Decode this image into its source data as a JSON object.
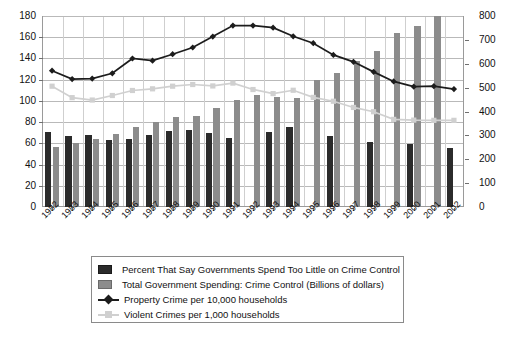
{
  "chart_data": {
    "type": "bar",
    "title": "",
    "subtitle": "",
    "xlabel": "",
    "ylabel": "",
    "grid": true,
    "legend_position": "bottom",
    "categories": [
      "1982",
      "1983",
      "1984",
      "1985",
      "1986",
      "1987",
      "1988",
      "1989",
      "1990",
      "1991",
      "1992",
      "1993",
      "1994",
      "1995",
      "1996",
      "1997",
      "1998",
      "1999",
      "2000",
      "2001",
      "2002"
    ],
    "axes": {
      "left": {
        "label": "",
        "ticks": [
          0,
          20,
          40,
          60,
          80,
          100,
          120,
          140,
          160,
          180
        ],
        "ylim": [
          0,
          180
        ],
        "applies_to": [
          "Percent That Say Governments Spend Too Little on Crime Control",
          "Total Government Spending: Crime Control (Billions of dollars)"
        ]
      },
      "right": {
        "label": "",
        "ticks": [
          0,
          100,
          200,
          300,
          400,
          500,
          600,
          700,
          800
        ],
        "ylim": [
          0,
          800
        ],
        "applies_to": [
          "Property Crime per 10,000 households",
          "Violent Crimes per 1,000 households"
        ]
      }
    },
    "series": [
      {
        "name": "Percent That Say Governments Spend Too Little on Crime Control",
        "type": "bar",
        "axis": "left",
        "color": "#2b2b2b",
        "values": [
          71,
          67,
          68,
          63,
          64,
          68,
          72,
          73,
          70,
          65,
          null,
          71,
          75,
          null,
          67,
          null,
          61,
          null,
          59,
          null,
          56
        ]
      },
      {
        "name": "Total Government Spending: Crime Control (Billions of dollars)",
        "type": "bar",
        "axis": "left",
        "color": "#8c8c8c",
        "values": [
          57,
          60,
          64,
          69,
          75,
          80,
          85,
          86,
          93,
          101,
          106,
          104,
          103,
          120,
          126,
          138,
          147,
          164,
          171,
          180,
          null
        ]
      },
      {
        "name": "Property Crime per 10,000 households",
        "type": "line",
        "axis": "right",
        "color": "#1c1c1c",
        "marker": "diamond",
        "values": [
          571,
          536,
          538,
          560,
          622,
          613,
          640,
          668,
          714,
          760,
          760,
          751,
          715,
          686,
          637,
          608,
          566,
          526,
          504,
          506,
          494
        ]
      },
      {
        "name": "Violent Crimes per 1,000 households",
        "type": "line",
        "axis": "right",
        "color": "#d0d0d0",
        "marker": "square",
        "values": [
          506,
          458,
          448,
          467,
          488,
          495,
          506,
          513,
          507,
          519,
          492,
          475,
          489,
          459,
          443,
          417,
          399,
          367,
          364,
          363,
          363
        ]
      }
    ],
    "legend": [
      {
        "label": "Percent That Say Governments Spend Too Little on Crime Control",
        "marker": "swatch-dark"
      },
      {
        "label": "Total Government Spending: Crime Control (Billions of dollars)",
        "marker": "swatch-gray"
      },
      {
        "label": "Property Crime per 10,000 households",
        "marker": "line-dark-diamond"
      },
      {
        "label": "Violent Crimes per 1,000 households",
        "marker": "line-light-square"
      }
    ]
  }
}
